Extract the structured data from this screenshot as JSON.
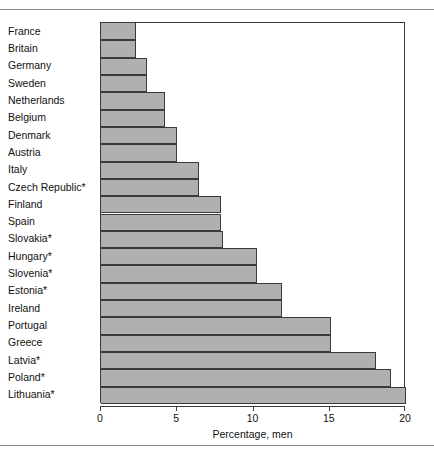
{
  "chart_data": {
    "type": "bar",
    "orientation": "horizontal",
    "title": "",
    "xlabel": "Percentage, men",
    "ylabel": "",
    "xlim": [
      0,
      20
    ],
    "xticks": [
      0,
      5,
      10,
      15,
      20
    ],
    "xtick_labels": [
      "0",
      "5",
      "10",
      "15",
      "20"
    ],
    "grid": false,
    "legend": false,
    "bar_color": "#b0b0b0",
    "bar_edge_color": "#3b3b3b",
    "categories": [
      "France",
      "Britain",
      "Germany",
      "Sweden",
      "Netherlands",
      "Belgium",
      "Denmark",
      "Austria",
      "Italy",
      "Czech Republic*",
      "Finland",
      "Spain",
      "Slovakia*",
      "Hungary*",
      "Slovenia*",
      "Estonia*",
      "Ireland",
      "Portugal",
      "Greece",
      "Latvia*",
      "Poland*",
      "Lithuania*"
    ],
    "values": [
      2.3,
      2.3,
      3.0,
      3.0,
      4.2,
      4.2,
      5.0,
      5.0,
      6.4,
      6.4,
      7.9,
      7.9,
      8.0,
      10.2,
      10.2,
      11.9,
      11.9,
      15.1,
      15.1,
      18.0,
      19.0,
      20.0
    ]
  },
  "figure": {
    "footnote_marker": "*"
  }
}
